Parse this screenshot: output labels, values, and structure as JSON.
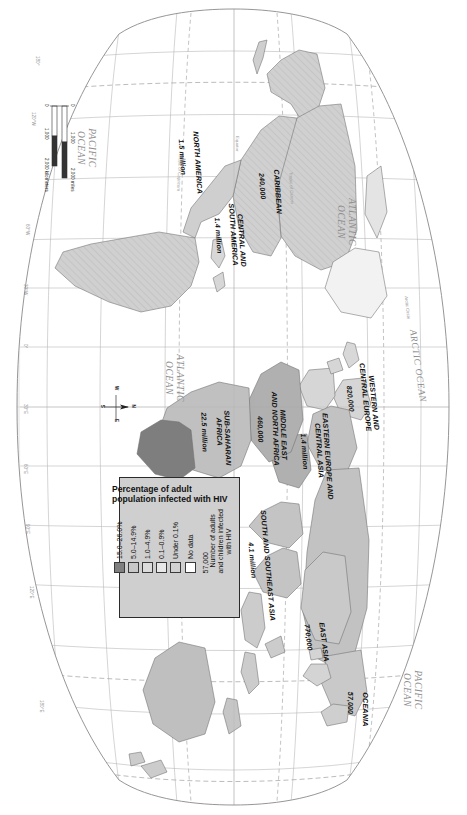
{
  "figure": {
    "kind": "world-map",
    "orientation_note": "page rotated 90 degrees"
  },
  "legend": {
    "title": "Percentage of\nadult population\ninfected with HIV",
    "classes": [
      {
        "label": "15.0–26.0%",
        "color": "#7f7f7f"
      },
      {
        "label": "5.0–14.9%",
        "color": "#c8c8c8"
      },
      {
        "label": "1.0–4.9%",
        "color": "#dcdcdc"
      },
      {
        "label": "0.1–0.9%",
        "color": "#e8e8e8"
      },
      {
        "label": "Under 0.1%",
        "color": "#d2d2d2"
      },
      {
        "label": "No data",
        "color": "#ffffff"
      }
    ],
    "note_number": "57,000",
    "note_text": "Number of adults\nand children infected\nwith HIV"
  },
  "regions": [
    {
      "name": "NORTH AMERICA",
      "value": "1.5 million",
      "x": 157,
      "y": 268,
      "rot": 0,
      "w": 92
    },
    {
      "name": "CARIBBEAN",
      "value": "240,000",
      "x": 186,
      "y": 186,
      "rot": 0,
      "w": 70
    },
    {
      "name": "CENTRAL AND\nSOUTH AMERICA",
      "value": "1.4 million",
      "x": 235,
      "y": 226,
      "rot": 0,
      "w": 86
    },
    {
      "name": "WESTERN AND\nCENTRAL EUROPE",
      "value": "820,000",
      "x": 398,
      "y": 93,
      "rot": 0,
      "w": 86
    },
    {
      "name": "EASTERN EUROPE AND\nCENTRAL ASIA",
      "value": "1.4 million",
      "x": 451,
      "y": 141,
      "rot": 0,
      "w": 110
    },
    {
      "name": "MIDDLE EAST\nAND NORTH AFRICA",
      "value": "460,000",
      "x": 429,
      "y": 182,
      "rot": 0,
      "w": 96
    },
    {
      "name": "SUB-SAHARAN\nAFRICA",
      "value": "22.5 million",
      "x": 432,
      "y": 238,
      "rot": 0,
      "w": 80
    },
    {
      "name": "SOUTH AND SOUTHEAST ASIA",
      "value": "4.1 million",
      "x": 560,
      "y": 198,
      "rot": 0,
      "w": 132
    },
    {
      "name": "EAST ASIA",
      "value": "770,000",
      "x": 637,
      "y": 142,
      "rot": 0,
      "w": 70
    },
    {
      "name": "OCEANIA",
      "value": "57,000",
      "x": 703,
      "y": 100,
      "rot": 0,
      "w": 60
    }
  ],
  "oceans": [
    {
      "name": "ARCTIC OCEAN",
      "x": 366,
      "y": 50,
      "w": 110,
      "size": 9.2
    },
    {
      "name": "ATLANTIC\nOCEAN",
      "x": 222,
      "y": 118,
      "w": 86,
      "size": 9.5
    },
    {
      "name": "ATLANTIC\nOCEAN",
      "x": 378,
      "y": 290,
      "w": 86,
      "size": 9.5
    },
    {
      "name": "PACIFIC\nOCEAN",
      "x": 148,
      "y": 378,
      "w": 78,
      "size": 9.5
    },
    {
      "name": "PACIFIC\nOCEAN",
      "x": 690,
      "y": 52,
      "w": 78,
      "size": 9.5
    },
    {
      "name": "INDIAN\nOCEAN",
      "x": 588,
      "y": 288,
      "w": 78,
      "size": 9.5
    }
  ],
  "latitude_lines": [
    {
      "label": "Arctic Circle",
      "x": 329,
      "y": 62
    },
    {
      "label": "Tropic of Cancer",
      "x": 200,
      "y": 178
    },
    {
      "label": "Equator",
      "x": 160,
      "y": 232
    },
    {
      "label": "Tropic of Capricorn",
      "x": 182,
      "y": 290
    }
  ],
  "longitude_labels": [
    {
      "label": "180°",
      "x": 60,
      "y": 434
    },
    {
      "label": "120°W",
      "x": 118,
      "y": 434
    },
    {
      "label": "60°W",
      "x": 228,
      "y": 434
    },
    {
      "label": "30°W",
      "x": 288,
      "y": 434
    },
    {
      "label": "0°",
      "x": 347,
      "y": 434
    },
    {
      "label": "30°E",
      "x": 408,
      "y": 434
    },
    {
      "label": "60°E",
      "x": 470,
      "y": 434
    },
    {
      "label": "90°E",
      "x": 530,
      "y": 434
    },
    {
      "label": "120°E",
      "x": 592,
      "y": 434
    },
    {
      "label": "180°E",
      "x": 706,
      "y": 434
    }
  ],
  "compass": {
    "n": "N",
    "s": "S",
    "e": "E",
    "w": "W"
  },
  "scalebar": {
    "miles_ticks": [
      "0",
      "1,000",
      "2,000 miles"
    ],
    "km_ticks": [
      "0",
      "1,000",
      "2,000 kilometers"
    ]
  }
}
